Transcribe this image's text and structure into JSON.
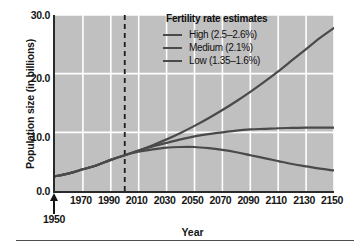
{
  "chart_data": {
    "type": "line",
    "title": "",
    "xlabel": "Year",
    "ylabel": "Population size (in billions)",
    "xlim": [
      1950,
      2150
    ],
    "ylim": [
      0.0,
      30.0
    ],
    "grid": true,
    "legend_position": "top-right",
    "legend_title": "Fertility rate estimates",
    "x_ticks": [
      1970,
      1990,
      2010,
      2030,
      2050,
      2070,
      2090,
      2110,
      2130,
      2150
    ],
    "x_tick_labels": [
      "1970",
      "1990",
      "2010",
      "2030",
      "2050",
      "2070",
      "2090",
      "2110",
      "2130",
      "2150"
    ],
    "y_ticks": [
      0.0,
      10.0,
      20.0,
      30.0
    ],
    "y_tick_labels": [
      "0.0",
      "10.0",
      "20.0",
      "30.0"
    ],
    "start_marker_label": "1950",
    "annotations": [
      {
        "name": "present-day-marker",
        "type": "vertical-dashed-line",
        "x": 2000
      }
    ],
    "x": [
      1950,
      1960,
      1970,
      1980,
      1990,
      2000,
      2010,
      2020,
      2030,
      2040,
      2050,
      2060,
      2070,
      2080,
      2090,
      2100,
      2110,
      2120,
      2130,
      2140,
      2150
    ],
    "series": [
      {
        "name": "High",
        "label": "High (2.5–2.6%)",
        "rate": "2.5–2.6%",
        "color": "#4a4a4a",
        "values": [
          2.5,
          3.0,
          3.7,
          4.4,
          5.3,
          6.1,
          6.9,
          7.8,
          8.8,
          9.9,
          11.1,
          12.4,
          13.8,
          15.3,
          16.9,
          18.6,
          20.4,
          22.3,
          24.2,
          26.1,
          27.8
        ]
      },
      {
        "name": "Medium",
        "label": "Medium (2.1%)",
        "rate": "2.1%",
        "color": "#4a4a4a",
        "values": [
          2.5,
          3.0,
          3.7,
          4.4,
          5.3,
          6.1,
          6.9,
          7.6,
          8.2,
          8.8,
          9.3,
          9.7,
          10.0,
          10.3,
          10.5,
          10.6,
          10.7,
          10.75,
          10.8,
          10.8,
          10.8
        ]
      },
      {
        "name": "Low",
        "label": "Low (1.35–1.6%)",
        "rate": "1.35–1.6%",
        "color": "#4a4a4a",
        "values": [
          2.5,
          3.0,
          3.7,
          4.4,
          5.3,
          6.1,
          6.7,
          7.1,
          7.4,
          7.5,
          7.5,
          7.3,
          7.0,
          6.6,
          6.1,
          5.6,
          5.1,
          4.6,
          4.2,
          3.8,
          3.5
        ]
      }
    ]
  },
  "figure": {
    "plot_background": "#c0c0c0",
    "gridline_color": "#ffffff",
    "axis_color": "#2a2a2a",
    "line_color": "#4a4a4a"
  }
}
